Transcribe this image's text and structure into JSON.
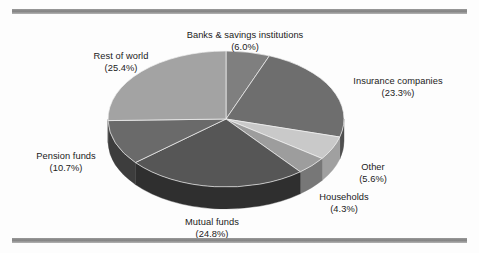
{
  "figure": {
    "background_color": "#fdfdfd",
    "rule_color": "#8a8a8a",
    "label_text_color": "#1b1b1b"
  },
  "chart_data": {
    "type": "pie",
    "title": "",
    "subtitle": "",
    "xlabel": "",
    "ylabel": "",
    "legend_position": "none",
    "grid": false,
    "style": "3d-pie",
    "start_angle_deg": 0,
    "direction": "clockwise",
    "units": "percent",
    "total": 100.1,
    "categories": [
      "Banks & savings institutions",
      "Insurance companies",
      "Other",
      "Households",
      "Mutual funds",
      "Pension funds",
      "Rest of world"
    ],
    "values": [
      6.0,
      23.3,
      5.6,
      4.3,
      24.8,
      10.7,
      25.4
    ],
    "slice_colors": [
      "#7f7f7f",
      "#6e6e6e",
      "#c9c9c9",
      "#9d9d9d",
      "#565656",
      "#6a6a6a",
      "#a3a3a3"
    ],
    "slices": [
      {
        "name": "Banks & savings institutions",
        "value": 6.0,
        "label": "Banks & savings institutions",
        "percent_label": "(6.0%)",
        "color": "#7f7f7f",
        "side_color": "#5e5e5e"
      },
      {
        "name": "Insurance companies",
        "value": 23.3,
        "label": "Insurance companies",
        "percent_label": "(23.3%)",
        "color": "#6e6e6e",
        "side_color": "#4f4f4f"
      },
      {
        "name": "Other",
        "value": 5.6,
        "label": "Other",
        "percent_label": "(5.6%)",
        "color": "#c9c9c9",
        "side_color": "#a0a0a0"
      },
      {
        "name": "Households",
        "value": 4.3,
        "label": "Households",
        "percent_label": "(4.3%)",
        "color": "#9d9d9d",
        "side_color": "#777777"
      },
      {
        "name": "Mutual funds",
        "value": 24.8,
        "label": "Mutual funds",
        "percent_label": "(24.8%)",
        "color": "#565656",
        "side_color": "#2f2f2f"
      },
      {
        "name": "Pension funds",
        "value": 10.7,
        "label": "Pension funds",
        "percent_label": "(10.7%)",
        "color": "#6a6a6a",
        "side_color": "#3d3d3d"
      },
      {
        "name": "Rest of world",
        "value": 25.4,
        "label": "Rest of world",
        "percent_label": "(25.4%)",
        "color": "#a3a3a3",
        "side_color": "#6f6f6f"
      }
    ]
  }
}
